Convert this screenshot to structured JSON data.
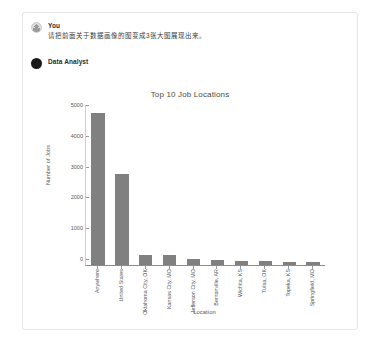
{
  "conversation": {
    "messages": [
      {
        "author": "You",
        "avatar_icon": "user-avatar-icon",
        "text": "请把前面关于数据画像的图变成3张大图展现出来。"
      },
      {
        "author": "Data Analyst",
        "avatar_icon": "assistant-avatar-icon",
        "text": ""
      }
    ]
  },
  "colors": {
    "bar": "#808080",
    "axis": "#8c8c8c",
    "card_border": "#e6e6e6",
    "text": "#3a3a3a"
  },
  "chart_data": {
    "type": "bar",
    "title": "Top 10 Job Locations",
    "xlabel": "Location",
    "ylabel": "Number of Jobs",
    "categories": [
      "Anywhere",
      "United States",
      "Oklahoma City, OK",
      "Kansas City, MO",
      "Jefferson City, MO",
      "Bentonville, AR",
      "Wichita, KS",
      "Tulsa, OK",
      "Topeka, KS",
      "Springfield, MO"
    ],
    "values": [
      4950,
      2950,
      330,
      320,
      200,
      170,
      130,
      120,
      110,
      100
    ],
    "ylim": [
      0,
      5200
    ],
    "yticks": [
      0,
      1000,
      2000,
      3000,
      4000,
      5000
    ],
    "ytick_labels": [
      "0",
      "1000",
      "2000",
      "3000",
      "4000",
      "5000"
    ],
    "grid": false,
    "legend": null
  }
}
